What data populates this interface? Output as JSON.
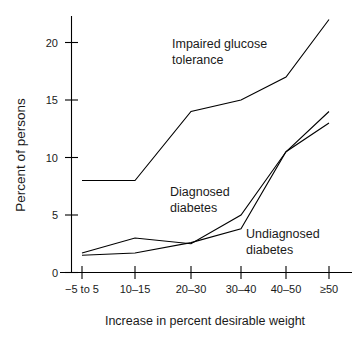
{
  "chart_data": {
    "type": "line",
    "title": "",
    "xlabel": "Increase in percent desirable weight",
    "ylabel": "Percent of persons",
    "categories": [
      "−5 to 5",
      "10–15",
      "20–30",
      "30–40",
      "40–50",
      "≥50"
    ],
    "yticks": [
      0,
      5,
      10,
      15,
      20
    ],
    "ytick_labels": [
      "0",
      "5",
      "10",
      "15",
      "20"
    ],
    "ylim": [
      0,
      22.5
    ],
    "grid": false,
    "legend_position": "inline-annotations",
    "series": [
      {
        "name": "Impaired glucose tolerance",
        "values": [
          8,
          8,
          14,
          15,
          17,
          22
        ],
        "label": "Impaired glucose\ntolerance",
        "label_line1": "Impaired glucose",
        "label_line2": "tolerance"
      },
      {
        "name": "Diagnosed diabetes",
        "values": [
          1.7,
          3,
          2.5,
          5,
          10.5,
          14
        ],
        "label": "Diagnosed\ndiabetes",
        "label_line1": "Diagnosed",
        "label_line2": "diabetes"
      },
      {
        "name": "Undiagnosed diabetes",
        "values": [
          1.5,
          1.7,
          2.6,
          3.8,
          10.5,
          13
        ],
        "label": "Undiagnosed\ndiabetes",
        "label_line1": "Undiagnosed",
        "label_line2": "diabetes"
      }
    ],
    "colors": {
      "line": "#000000",
      "axis": "#000000",
      "text": "#1a1a1a",
      "background": "#ffffff"
    }
  },
  "axes": {
    "y_title": "Percent of persons",
    "x_title": "Increase in percent desirable weight",
    "y_tick_0": "0",
    "y_tick_5": "5",
    "y_tick_10": "10",
    "y_tick_15": "15",
    "y_tick_20": "20",
    "x_tick_0": "−5 to 5",
    "x_tick_1": "10–15",
    "x_tick_2": "20–30",
    "x_tick_3": "30–40",
    "x_tick_4": "40–50",
    "x_tick_5": "≥50"
  },
  "annotations": {
    "igt_line1": "Impaired glucose",
    "igt_line2": "tolerance",
    "diag_line1": "Diagnosed",
    "diag_line2": "diabetes",
    "undiag_line1": "Undiagnosed",
    "undiag_line2": "diabetes"
  }
}
